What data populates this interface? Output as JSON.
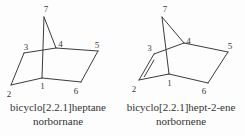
{
  "diagram": {
    "type": "chemical-structure-diagram",
    "background_color": "#fdfdfd",
    "ink_color": "#3c3c3c",
    "text_color": "#333333"
  },
  "molecules": [
    {
      "id": "norbornane",
      "caption_line1": "bicyclo[2.2.1]heptane",
      "caption_line2": "norbornane",
      "atoms": {
        "a1": "1",
        "a2": "2",
        "a3": "3",
        "a4": "4",
        "a5": "5",
        "a6": "6",
        "a7": "7"
      },
      "bonds": "C1-C2, C2-C3, C3-C4, C4-C5, C5-C6, C6-C1, C1-C7, C4-C7 (all single)"
    },
    {
      "id": "norbornene",
      "caption_line1": "bicyclo[2.2.1]hept-2-ene",
      "caption_line2": "norbornene",
      "atoms": {
        "a1": "1",
        "a2": "2",
        "a3": "3",
        "a4": "4",
        "a5": "5",
        "a6": "6",
        "a7": "7"
      },
      "bonds": "C1-C2, C2=C3 (double), C3-C4, C4-C5, C5-C6, C6-C1, C1-C7, C4-C7"
    }
  ]
}
